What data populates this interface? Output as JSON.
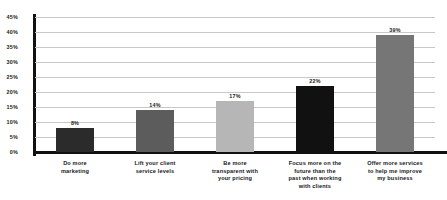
{
  "chart_data": {
    "type": "bar",
    "title": "",
    "subtitle": "",
    "xlabel": "",
    "ylabel": "",
    "ylim": [
      0,
      45
    ],
    "ytick_step": 5,
    "grid": true,
    "legend": null,
    "categories": [
      "Do more marketing",
      "Lift your client service levels",
      "Be more transparent with your pricing",
      "Focus more on the future than the past when working with clients",
      "Offer more services to help me improve my business"
    ],
    "values": [
      8,
      14,
      17,
      22,
      39
    ],
    "value_labels": [
      "8%",
      "14%",
      "17%",
      "22%",
      "39%"
    ],
    "bar_colors": [
      "#2b2b2b",
      "#5c5c5c",
      "#b6b6b6",
      "#111111",
      "#767676"
    ],
    "ytick_labels": [
      "45%",
      "40%",
      "35%",
      "30%",
      "25%",
      "20%",
      "15%",
      "10%",
      "5%",
      "0%"
    ],
    "ytick_values": [
      45,
      40,
      35,
      30,
      25,
      20,
      15,
      10,
      5,
      0
    ],
    "axis_color": "#111111",
    "gridline_color": "#c8c8c8",
    "background": "#ffffff",
    "category_lines": [
      [
        "Do more",
        "marketing"
      ],
      [
        "Lift your client",
        "service levels"
      ],
      [
        "Be more",
        "transparent with",
        "your pricing"
      ],
      [
        "Focus more on the",
        "future than the",
        "past when working",
        "with clients"
      ],
      [
        "Offer more services",
        "to help me improve",
        "my business"
      ]
    ]
  }
}
